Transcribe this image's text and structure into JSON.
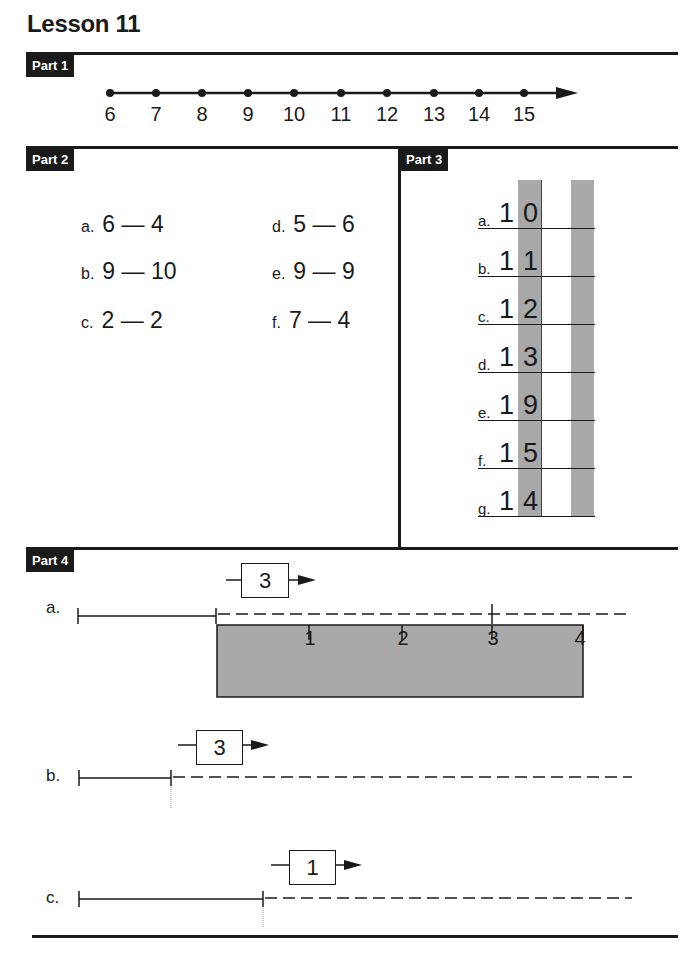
{
  "header": {
    "title": "Lesson 11"
  },
  "part1": {
    "label": "Part 1",
    "number_line": {
      "values": [
        "6",
        "7",
        "8",
        "9",
        "10",
        "11",
        "12",
        "13",
        "14",
        "15"
      ]
    }
  },
  "part2": {
    "label": "Part 2",
    "items": [
      {
        "letter": "a.",
        "left": "6",
        "dash": "—",
        "right": "4"
      },
      {
        "letter": "b.",
        "left": "9",
        "dash": "—",
        "right": "10"
      },
      {
        "letter": "c.",
        "left": "2",
        "dash": "—",
        "right": "2"
      },
      {
        "letter": "d.",
        "left": "5",
        "dash": "—",
        "right": "6"
      },
      {
        "letter": "e.",
        "left": "9",
        "dash": "—",
        "right": "9"
      },
      {
        "letter": "f.",
        "left": "7",
        "dash": "—",
        "right": "4"
      }
    ]
  },
  "part3": {
    "label": "Part 3",
    "items": [
      {
        "letter": "a.",
        "tens": "1",
        "ones": "0"
      },
      {
        "letter": "b.",
        "tens": "1",
        "ones": "1"
      },
      {
        "letter": "c.",
        "tens": "1",
        "ones": "2"
      },
      {
        "letter": "d.",
        "tens": "1",
        "ones": "3"
      },
      {
        "letter": "e.",
        "tens": "1",
        "ones": "9"
      },
      {
        "letter": "f.",
        "tens": "1",
        "ones": "5"
      },
      {
        "letter": "g.",
        "tens": "1",
        "ones": "4"
      }
    ]
  },
  "part4": {
    "label": "Part 4",
    "rows": [
      {
        "letter": "a.",
        "box_value": "3",
        "ruler": [
          "1",
          "2",
          "3",
          "4"
        ]
      },
      {
        "letter": "b.",
        "box_value": "3"
      },
      {
        "letter": "c.",
        "box_value": "1"
      }
    ]
  },
  "colors": {
    "ink": "#1a1a1a",
    "shade": "#a9a9a9",
    "paper": "#ffffff"
  }
}
